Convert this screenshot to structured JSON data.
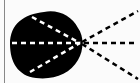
{
  "diagram": {
    "colors": {
      "background": "#fbfbfb",
      "blob": "#000000",
      "inner_rays": "#ffffff",
      "outer_rays": "#000000",
      "border": "#888888"
    },
    "focal_point": {
      "x": 80,
      "y": 43
    },
    "inner_rays": [
      {
        "from": [
          32,
          16
        ],
        "to": [
          80,
          43
        ]
      },
      {
        "from": [
          12,
          43
        ],
        "to": [
          80,
          43
        ]
      },
      {
        "from": [
          30,
          72
        ],
        "to": [
          80,
          43
        ]
      }
    ],
    "outer_rays": [
      {
        "from": [
          80,
          43
        ],
        "to": [
          138,
          11
        ]
      },
      {
        "from": [
          80,
          43
        ],
        "to": [
          138,
          43
        ]
      },
      {
        "from": [
          80,
          43
        ],
        "to": [
          138,
          79
        ]
      }
    ]
  }
}
